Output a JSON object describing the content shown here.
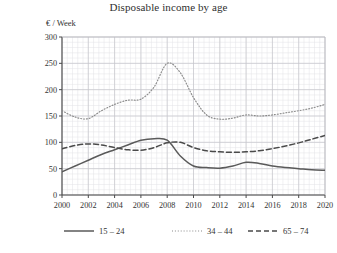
{
  "chart_data": {
    "type": "line",
    "title": "Disposable income by age",
    "ylabel": "€ / Week",
    "xlabel": "",
    "xlim": [
      2000,
      2020
    ],
    "ylim": [
      0,
      300
    ],
    "ytick_step": 50,
    "yticks": [
      0,
      50,
      100,
      150,
      200,
      250,
      300
    ],
    "xticks": [
      2000,
      2002,
      2004,
      2006,
      2008,
      2010,
      2012,
      2014,
      2016,
      2018,
      2020
    ],
    "grid": true,
    "minor_grid": true,
    "legend_position": "below",
    "x": [
      2000,
      2001,
      2002,
      2003,
      2004,
      2005,
      2006,
      2007,
      2008,
      2009,
      2010,
      2011,
      2012,
      2013,
      2014,
      2015,
      2016,
      2017,
      2018,
      2019,
      2020
    ],
    "series": [
      {
        "name": "15 – 24",
        "style": "solid",
        "color": "#5a5a5a",
        "values": [
          44,
          55,
          66,
          77,
          86,
          95,
          104,
          107,
          104,
          74,
          55,
          52,
          51,
          55,
          62,
          60,
          55,
          52,
          50,
          48,
          47
        ]
      },
      {
        "name": "34 – 44",
        "style": "dotted",
        "color": "#8a8a8a",
        "values": [
          160,
          148,
          145,
          160,
          172,
          180,
          182,
          205,
          250,
          232,
          185,
          152,
          144,
          146,
          152,
          150,
          152,
          156,
          160,
          165,
          172
        ]
      },
      {
        "name": "65 – 74",
        "style": "dashed",
        "color": "#4a4a4a",
        "values": [
          88,
          94,
          97,
          95,
          90,
          86,
          85,
          90,
          99,
          100,
          90,
          84,
          82,
          81,
          82,
          84,
          88,
          93,
          99,
          106,
          113
        ]
      }
    ]
  }
}
